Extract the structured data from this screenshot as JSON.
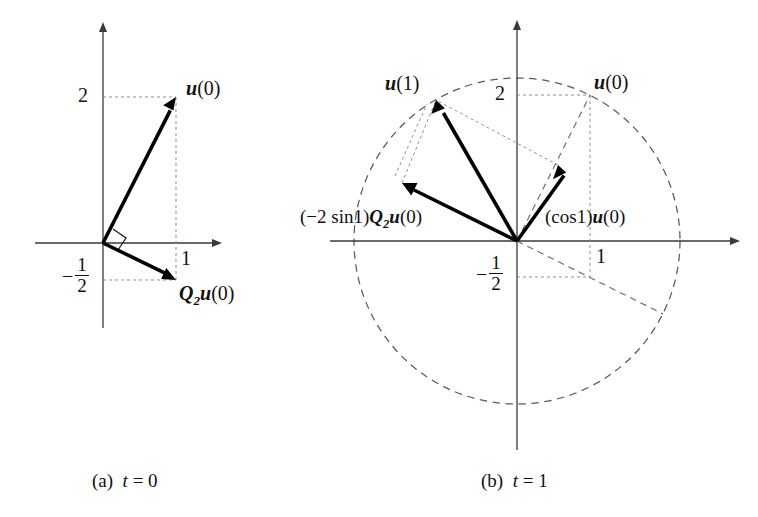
{
  "figure": {
    "panels": [
      {
        "id": "panel-a",
        "caption_index": "(a)",
        "caption_var": "t",
        "caption_eq": "= 0",
        "origin": [
          103,
          243
        ],
        "scale": 73,
        "axes": {
          "x_from": [
            35,
            243
          ],
          "x_to": [
            222,
            243
          ],
          "y_from": [
            103,
            328
          ],
          "y_to": [
            103,
            22
          ]
        },
        "ticks": [
          {
            "name": "y-tick-2",
            "text": "2",
            "x": 78,
            "y": 85
          },
          {
            "name": "x-tick-1",
            "text": "1",
            "x": 181,
            "y": 248
          },
          {
            "name": "y-tick-neg-half",
            "numerator": "1",
            "denominator": "2",
            "x": 62,
            "y": 258
          }
        ],
        "vectors": [
          {
            "name": "vector-u0",
            "label": "u(0)",
            "bold_sym": "u",
            "arg": "(0)",
            "tip": [
              176,
              97
            ],
            "label_x": 186,
            "label_y": 78
          },
          {
            "name": "vector-q2u0",
            "label": "Q2u(0)",
            "bold_sym": "Q",
            "sub": "2",
            "bold_sym2": "u",
            "arg": "(0)",
            "tip": [
              176,
              280
            ],
            "label_x": 179,
            "label_y": 283
          }
        ],
        "right_angle": true
      },
      {
        "id": "panel-b",
        "caption_index": "(b)",
        "caption_var": "t",
        "caption_eq": "= 1",
        "origin": [
          517,
          241
        ],
        "scale": 73,
        "circle_radius": 163,
        "axes": {
          "x_from": [
            330,
            241
          ],
          "x_to": [
            740,
            241
          ],
          "y_from": [
            517,
            450
          ],
          "y_to": [
            517,
            20
          ]
        },
        "ticks": [
          {
            "name": "y-tick-2",
            "text": "2",
            "x": 495,
            "y": 83
          },
          {
            "name": "x-tick-1",
            "text": "1",
            "x": 596,
            "y": 246
          },
          {
            "name": "y-tick-neg-half",
            "numerator": "1",
            "denominator": "2",
            "x": 476,
            "y": 256
          }
        ],
        "vectors": [
          {
            "name": "vector-u1",
            "bold_sym": "u",
            "arg": "(1)",
            "tip": [
              436,
              100
            ],
            "label_x": 385,
            "label_y": 73
          },
          {
            "name": "vector-u0",
            "bold_sym": "u",
            "arg": "(0)",
            "tip": [
              590,
              95
            ],
            "label_x": 594,
            "label_y": 72
          },
          {
            "name": "vector-cos1-u0",
            "prefix": "(cos1)",
            "bold_sym": "u",
            "arg": "(0)",
            "tip": [
              558,
              165
            ],
            "label_x": 545,
            "label_y": 207
          },
          {
            "name": "vector-neg2sin1-q2u0",
            "prefix": "(−2 sin1)",
            "bold_sym": "Q",
            "sub": "2",
            "bold_sym2": "u",
            "arg": "(0)",
            "tip": [
              402,
              183
            ],
            "label_x": 300,
            "label_y": 207
          }
        ]
      }
    ]
  }
}
